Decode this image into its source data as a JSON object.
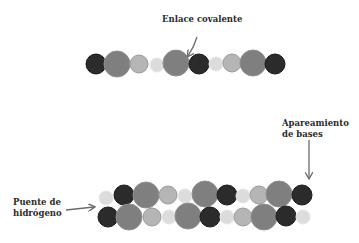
{
  "labels": {
    "covalent_bond": "Enlace covalente",
    "base_pairing_line1": "Apareamiento",
    "base_pairing_line2": "de bases",
    "hydrogen_bond_line1": "Puente de",
    "hydrogen_bond_line2": "hidrógeno"
  },
  "colors": {
    "dark": "#2b2b2b",
    "medium": "#7f7f7f",
    "light": "#b5b5b5",
    "pale": "#dcdcdc",
    "arrow": "#6a6a6a"
  },
  "strands": {
    "single": [
      {
        "x": 96,
        "y": 64,
        "r": 10,
        "type": "dark"
      },
      {
        "x": 117,
        "y": 64,
        "r": 13,
        "type": "medium"
      },
      {
        "x": 139,
        "y": 64,
        "r": 9,
        "type": "light"
      },
      {
        "x": 157,
        "y": 65,
        "r": 7,
        "type": "pale"
      },
      {
        "x": 176,
        "y": 63,
        "r": 13,
        "type": "medium"
      },
      {
        "x": 199,
        "y": 64,
        "r": 10,
        "type": "dark"
      },
      {
        "x": 216,
        "y": 64,
        "r": 7,
        "type": "pale"
      },
      {
        "x": 232,
        "y": 63,
        "r": 9,
        "type": "light"
      },
      {
        "x": 253,
        "y": 63,
        "r": 13,
        "type": "medium"
      },
      {
        "x": 275,
        "y": 64,
        "r": 10,
        "type": "dark"
      }
    ],
    "double_top": [
      {
        "x": 106,
        "y": 198,
        "r": 7,
        "type": "pale"
      },
      {
        "x": 124,
        "y": 195,
        "r": 10,
        "type": "dark"
      },
      {
        "x": 146,
        "y": 195,
        "r": 13,
        "type": "medium"
      },
      {
        "x": 168,
        "y": 195,
        "r": 9,
        "type": "light"
      },
      {
        "x": 185,
        "y": 196,
        "r": 7,
        "type": "pale"
      },
      {
        "x": 205,
        "y": 194,
        "r": 13,
        "type": "medium"
      },
      {
        "x": 227,
        "y": 195,
        "r": 10,
        "type": "dark"
      },
      {
        "x": 243,
        "y": 196,
        "r": 7,
        "type": "pale"
      },
      {
        "x": 259,
        "y": 195,
        "r": 9,
        "type": "light"
      },
      {
        "x": 279,
        "y": 194,
        "r": 13,
        "type": "medium"
      },
      {
        "x": 302,
        "y": 195,
        "r": 10,
        "type": "dark"
      }
    ],
    "double_bottom": [
      {
        "x": 108,
        "y": 217,
        "r": 10,
        "type": "dark"
      },
      {
        "x": 129,
        "y": 217,
        "r": 13,
        "type": "medium"
      },
      {
        "x": 152,
        "y": 217,
        "r": 9,
        "type": "light"
      },
      {
        "x": 169,
        "y": 217,
        "r": 7,
        "type": "pale"
      },
      {
        "x": 188,
        "y": 216,
        "r": 13,
        "type": "medium"
      },
      {
        "x": 210,
        "y": 217,
        "r": 10,
        "type": "dark"
      },
      {
        "x": 227,
        "y": 217,
        "r": 7,
        "type": "pale"
      },
      {
        "x": 243,
        "y": 217,
        "r": 9,
        "type": "light"
      },
      {
        "x": 264,
        "y": 217,
        "r": 13,
        "type": "medium"
      },
      {
        "x": 286,
        "y": 216,
        "r": 10,
        "type": "dark"
      },
      {
        "x": 303,
        "y": 217,
        "r": 7,
        "type": "pale"
      }
    ]
  }
}
